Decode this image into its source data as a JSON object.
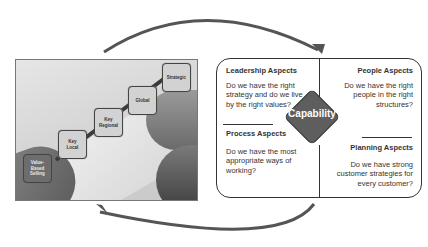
{
  "steps": [
    {
      "label": "Value-\nBased\nSelling",
      "shade": "dark"
    },
    {
      "label": "Key\nLocal",
      "shade": "light"
    },
    {
      "label": "Key\nRegional",
      "shade": "light"
    },
    {
      "label": "Global",
      "shade": "light"
    },
    {
      "label": "Strategic",
      "shade": "light"
    }
  ],
  "center": {
    "label": "Capability"
  },
  "quadrants": {
    "leadership": {
      "title": "Leadership Aspects",
      "text": "Do we have the right strategy and do we live by the right values?"
    },
    "people": {
      "title": "People Aspects",
      "text": "Do we have the right people in the right structures?"
    },
    "process": {
      "title": "Process Aspects",
      "text": "Do we have the most appropriate ways of working?"
    },
    "planning": {
      "title": "Planning Aspects",
      "text": "Do we have strong customer strategies for every customer?"
    }
  },
  "colors": {
    "diamond": "#5e5e5e",
    "border": "#333333",
    "arrow": "#555555"
  }
}
